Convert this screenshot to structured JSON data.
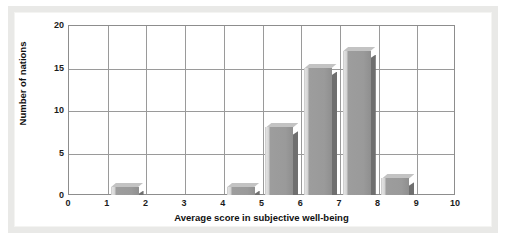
{
  "chart_data": {
    "type": "bar",
    "title": "",
    "subtitle": "",
    "xlabel": "Average score in subjective well-being",
    "ylabel": "Number of nations",
    "xlim": [
      0,
      10
    ],
    "ylim": [
      0,
      20
    ],
    "xticks": [
      "0",
      "1",
      "2",
      "3",
      "4",
      "5",
      "6",
      "7",
      "8",
      "9",
      "10"
    ],
    "yticks": [
      "0",
      "5",
      "10",
      "15",
      "20"
    ],
    "grid": true,
    "legend": null,
    "bin_width": 1,
    "categories": [
      "0-1",
      "1-2",
      "2-3",
      "3-4",
      "4-5",
      "5-6",
      "6-7",
      "7-8",
      "8-9",
      "9-10"
    ],
    "values": [
      0,
      1,
      0,
      0,
      1,
      8,
      15,
      17,
      2,
      0
    ],
    "bars": [
      {
        "bin_start": 0,
        "bin_end": 1,
        "value": 0
      },
      {
        "bin_start": 1,
        "bin_end": 2,
        "value": 1
      },
      {
        "bin_start": 2,
        "bin_end": 3,
        "value": 0
      },
      {
        "bin_start": 3,
        "bin_end": 4,
        "value": 0
      },
      {
        "bin_start": 4,
        "bin_end": 5,
        "value": 1
      },
      {
        "bin_start": 5,
        "bin_end": 6,
        "value": 8
      },
      {
        "bin_start": 6,
        "bin_end": 7,
        "value": 15
      },
      {
        "bin_start": 7,
        "bin_end": 8,
        "value": 17
      },
      {
        "bin_start": 8,
        "bin_end": 9,
        "value": 2
      },
      {
        "bin_start": 9,
        "bin_end": 10,
        "value": 0
      }
    ],
    "colors": {
      "bar_face": "#9a9a9a",
      "bar_side": "#6f6f6f",
      "bar_top": "#c3c3c3",
      "gridline": "#9a9a9a",
      "axis": "#8d8d8d",
      "plot_background": "#ffffff",
      "frame": "#e9e9e7",
      "text": "#111111"
    }
  }
}
